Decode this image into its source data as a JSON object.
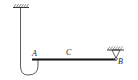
{
  "diagram": {
    "type": "mechanics-beam",
    "labels": {
      "a": "A",
      "c": "C",
      "b": "B"
    },
    "colors": {
      "line": "#222222",
      "beam": "#111111",
      "background": "#ffffff"
    }
  }
}
